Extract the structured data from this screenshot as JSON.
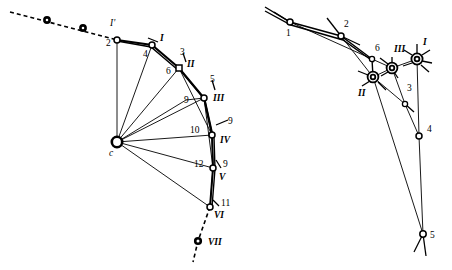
{
  "figure": {
    "background_color": "#ffffff",
    "stroke_color": "#000000",
    "width": 452,
    "height": 270,
    "panels": [
      {
        "id": "left-panel",
        "name": "kinematic-chain-diagram",
        "center_node": {
          "label": "c",
          "x": 117,
          "y": 142
        },
        "nodes": [
          {
            "label": "2",
            "kind": "open",
            "x": 117,
            "y": 40
          },
          {
            "label": "4",
            "kind": "open",
            "x": 152,
            "y": 45
          },
          {
            "label": "6",
            "kind": "square",
            "x": 179,
            "y": 68
          },
          {
            "label": "9",
            "kind": "open",
            "x": 204,
            "y": 98
          },
          {
            "label": "10",
            "kind": "open",
            "x": 212,
            "y": 135
          },
          {
            "label": "12",
            "kind": "open",
            "x": 213,
            "y": 168
          },
          {
            "label": "11",
            "kind": "open",
            "x": 210,
            "y": 207
          },
          {
            "label": "3",
            "kind": "tick",
            "x": 184,
            "y": 58
          },
          {
            "label": "5",
            "kind": "tick",
            "x": 214,
            "y": 84
          },
          {
            "label": "7",
            "kind": "tick",
            "x": 228,
            "y": 122
          },
          {
            "label": "9",
            "kind": "tick",
            "x": 224,
            "y": 165
          }
        ],
        "roman_labels": [
          {
            "label": "I'",
            "x": 112,
            "y": 27
          },
          {
            "label": "I",
            "x": 158,
            "y": 40
          },
          {
            "label": "II",
            "x": 188,
            "y": 63
          },
          {
            "label": "III",
            "x": 214,
            "y": 97
          },
          {
            "label": "IV",
            "x": 222,
            "y": 140
          },
          {
            "label": "V",
            "x": 221,
            "y": 177
          },
          {
            "label": "VI",
            "x": 215,
            "y": 215
          },
          {
            "label": "VII",
            "x": 207,
            "y": 243
          }
        ],
        "dashed_nodes": [
          {
            "x": 47,
            "y": 20
          },
          {
            "x": 83,
            "y": 28
          },
          {
            "x": 198,
            "y": 241
          }
        ],
        "dashed_label": "VII"
      },
      {
        "id": "right-panel",
        "name": "force-polygon-diagram",
        "nodes": [
          {
            "label": "1",
            "kind": "open",
            "x": 290,
            "y": 22
          },
          {
            "label": "2",
            "kind": "open",
            "x": 341,
            "y": 36
          },
          {
            "label": "6",
            "kind": "small",
            "x": 372,
            "y": 59
          },
          {
            "label": "3",
            "kind": "small",
            "x": 405,
            "y": 104
          },
          {
            "label": "4",
            "kind": "open",
            "x": 419,
            "y": 136
          },
          {
            "label": "5",
            "kind": "open",
            "x": 423,
            "y": 234
          }
        ],
        "double_nodes": [
          {
            "label": "II",
            "x": 373,
            "y": 77
          },
          {
            "label": "III",
            "x": 392,
            "y": 68
          },
          {
            "label": "I",
            "x": 417,
            "y": 59
          }
        ],
        "roman_labels": [
          {
            "label": "II",
            "x": 361,
            "y": 93
          },
          {
            "label": "III",
            "x": 397,
            "y": 51
          },
          {
            "label": "I",
            "x": 424,
            "y": 44
          }
        ],
        "number_labels": [
          {
            "label": "1",
            "x": 288,
            "y": 35
          },
          {
            "label": "2",
            "x": 344,
            "y": 26
          },
          {
            "label": "6",
            "x": 378,
            "y": 50
          },
          {
            "label": "3",
            "x": 409,
            "y": 90
          },
          {
            "label": "4",
            "x": 428,
            "y": 131
          },
          {
            "label": "5",
            "x": 431,
            "y": 237
          }
        ]
      }
    ]
  }
}
